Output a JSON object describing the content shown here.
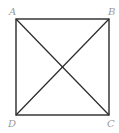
{
  "diagram": {
    "type": "square-with-diagonals",
    "vertices": {
      "A": {
        "label": "A",
        "x": 16,
        "y": 19
      },
      "B": {
        "label": "B",
        "x": 109,
        "y": 19
      },
      "C": {
        "label": "C",
        "x": 109,
        "y": 115
      },
      "D": {
        "label": "D",
        "x": 16,
        "y": 115
      }
    },
    "diagonals": [
      "AC",
      "BD"
    ],
    "stroke_color": "#2a2a2a",
    "label_color": "#9a9a9a"
  }
}
